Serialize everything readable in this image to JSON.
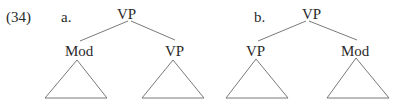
{
  "example_number": "(34)",
  "trees": [
    {
      "label": "a.",
      "root": "VP",
      "children": [
        {
          "label": "Mod",
          "has_triangle": true
        },
        {
          "label": "VP",
          "has_triangle": true
        }
      ]
    },
    {
      "label": "b.",
      "root": "VP",
      "children": [
        {
          "label": "VP",
          "has_triangle": true
        },
        {
          "label": "Mod",
          "has_triangle": true
        }
      ]
    }
  ],
  "colors": {
    "text": "#2a2a2a",
    "lines": "#6a6a6a"
  }
}
